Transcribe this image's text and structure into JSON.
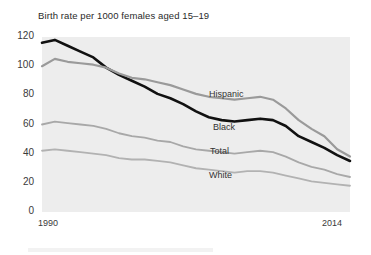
{
  "chart_data": {
    "type": "line",
    "title": "Birth rate per 1000 females aged 15–19",
    "xlabel": "",
    "ylabel": "",
    "xlim": [
      1990,
      2014
    ],
    "ylim": [
      0,
      120
    ],
    "yticks": [
      0,
      20,
      40,
      60,
      80,
      100,
      120
    ],
    "xticks": [
      1990,
      2014
    ],
    "xtick_labels": [
      "1990",
      "2014"
    ],
    "grid": false,
    "legend_position": "inline-labels",
    "x": [
      1990,
      1991,
      1992,
      1993,
      1994,
      1995,
      1996,
      1997,
      1998,
      1999,
      2000,
      2001,
      2002,
      2003,
      2004,
      2005,
      2006,
      2007,
      2008,
      2009,
      2010,
      2011,
      2012,
      2013,
      2014
    ],
    "series": [
      {
        "name": "Black",
        "color": "#111111",
        "width": 2.6,
        "label_x": 213,
        "label_y": 122,
        "values": [
          116,
          118,
          114,
          110,
          106,
          99,
          94,
          90,
          86,
          81,
          78,
          74,
          69,
          65,
          63,
          62,
          63,
          64,
          63,
          59,
          52,
          48,
          44,
          39,
          35
        ]
      },
      {
        "name": "Hispanic",
        "color": "#9a9a9a",
        "width": 2.2,
        "label_x": 209,
        "label_y": 89,
        "values": [
          100,
          105,
          103,
          102,
          101,
          99,
          95,
          92,
          91,
          89,
          87,
          84,
          81,
          79,
          78,
          77,
          78,
          79,
          77,
          71,
          63,
          57,
          52,
          43,
          38
        ]
      },
      {
        "name": "Total",
        "color": "#a8a8a8",
        "width": 1.8,
        "label_x": 210,
        "label_y": 146,
        "values": [
          60,
          62,
          61,
          60,
          59,
          57,
          54,
          52,
          51,
          49,
          48,
          45,
          43,
          42,
          41,
          40,
          41,
          42,
          41,
          38,
          34,
          31,
          29,
          26,
          24
        ]
      },
      {
        "name": "White",
        "color": "#b2b2b2",
        "width": 1.8,
        "label_x": 209,
        "label_y": 170,
        "values": [
          42,
          43,
          42,
          41,
          40,
          39,
          37,
          36,
          36,
          35,
          34,
          32,
          30,
          29,
          28,
          27,
          28,
          28,
          27,
          25,
          23,
          21,
          20,
          19,
          18
        ]
      }
    ]
  },
  "plot": {
    "bg_color": "#ededed",
    "left": 42,
    "right": 350,
    "top": 37,
    "bottom": 212
  }
}
